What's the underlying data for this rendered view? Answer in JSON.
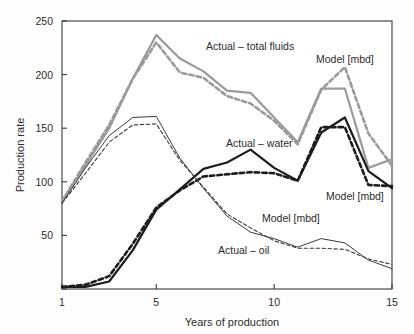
{
  "chart_data": {
    "type": "line",
    "title": "",
    "xlabel": "Years of production",
    "ylabel": "Production rate",
    "xlim": [
      1,
      15
    ],
    "ylim": [
      0,
      250
    ],
    "xticks": [
      1,
      5,
      10,
      15
    ],
    "yticks": [
      0,
      50,
      100,
      150,
      200,
      250
    ],
    "ytick_labels": [
      "",
      "50",
      "100",
      "150",
      "200",
      "250"
    ],
    "xtick_labels": [
      "1",
      "5",
      "10",
      "15"
    ],
    "grid": false,
    "legend_position": "inline-annotations",
    "x": [
      1,
      2,
      3,
      4,
      5,
      6,
      7,
      8,
      9,
      10,
      11,
      12,
      13,
      14,
      15
    ],
    "series": [
      {
        "name": "Actual - total fluids",
        "style": "solid",
        "color": "#9a9a9a",
        "width": 2.2,
        "values": [
          82,
          115,
          150,
          196,
          237,
          215,
          203,
          185,
          183,
          160,
          137,
          187,
          187,
          113,
          121
        ]
      },
      {
        "name": "Model [mbd] - total fluids",
        "style": "dashed",
        "color": "#9a9a9a",
        "width": 2.6,
        "values": [
          82,
          118,
          153,
          196,
          230,
          202,
          197,
          180,
          173,
          157,
          135,
          186,
          207,
          145,
          115
        ]
      },
      {
        "name": "Actual - water",
        "style": "solid",
        "color": "#1c1c1c",
        "width": 2.2,
        "values": [
          2,
          2,
          7,
          36,
          74,
          93,
          112,
          118,
          130,
          113,
          101,
          146,
          160,
          110,
          94
        ]
      },
      {
        "name": "Model [mbd] - water",
        "style": "dashed",
        "color": "#1c1c1c",
        "width": 2.6,
        "values": [
          2,
          4,
          12,
          42,
          76,
          92,
          105,
          107,
          109,
          108,
          101,
          151,
          151,
          97,
          96
        ]
      },
      {
        "name": "Actual - oil",
        "style": "solid",
        "color": "#3a3a3a",
        "width": 1.0,
        "values": [
          80,
          113,
          143,
          160,
          161,
          122,
          94,
          68,
          53,
          47,
          39,
          47,
          43,
          27,
          19
        ]
      },
      {
        "name": "Model [mbd] - oil",
        "style": "dashed",
        "color": "#3a3a3a",
        "width": 1.1,
        "values": [
          80,
          108,
          137,
          153,
          154,
          120,
          95,
          70,
          57,
          45,
          38,
          38,
          37,
          28,
          23
        ]
      }
    ],
    "annotations": [
      {
        "id": "ann-total-fluids",
        "text": "Actual – total fluids",
        "x_px": 206,
        "y_px": 50
      },
      {
        "id": "ann-model-total-fluids",
        "text": "Model [mbd]",
        "x_px": 316,
        "y_px": 63
      },
      {
        "id": "ann-water",
        "text": "Actual – water",
        "x_px": 226,
        "y_px": 147
      },
      {
        "id": "ann-model-water",
        "text": "Model [mbd]",
        "x_px": 326,
        "y_px": 200
      },
      {
        "id": "ann-model-oil",
        "text": "Model [mbd]",
        "x_px": 262,
        "y_px": 222
      },
      {
        "id": "ann-oil",
        "text": "Actual – oil",
        "x_px": 218,
        "y_px": 254
      }
    ]
  },
  "axes": {
    "y_title": "Production rate",
    "x_title": "Years of production"
  }
}
